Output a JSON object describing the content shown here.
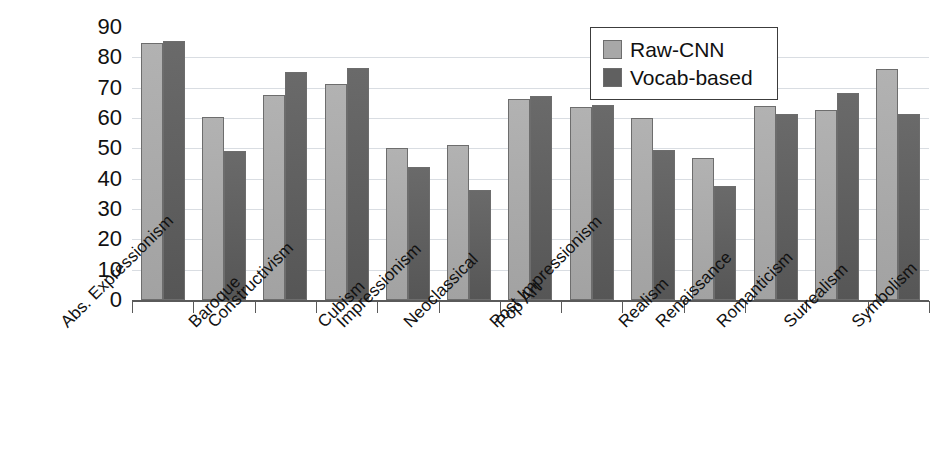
{
  "chart_data": {
    "type": "bar",
    "title": "",
    "xlabel": "",
    "ylabel": "",
    "ylim": [
      0,
      90
    ],
    "ytick_values": [
      90,
      80,
      70,
      60,
      50,
      40,
      30,
      20,
      10,
      0
    ],
    "ytick_labels": [
      "90",
      "80",
      "70",
      "60",
      "50",
      "40",
      "30",
      "20",
      "10",
      "0"
    ],
    "grid": true,
    "grid_axis": "y",
    "legend_position": "top-right",
    "categories": [
      "Abs. Expressionism",
      "Baroque",
      "Constructivism",
      "Cubism",
      "Impressionism",
      "Neoclassical",
      "Pop Art",
      "Post Impressionism",
      "Realism",
      "Renaissance",
      "Romanticism",
      "Surrealism",
      "Symbolism"
    ],
    "series": [
      {
        "name": "Raw-CNN",
        "color": "#a8a8a8",
        "values": [
          84.8,
          60.3,
          67.7,
          71.2,
          50.1,
          51.0,
          66.4,
          63.7,
          60.0,
          46.8,
          63.9,
          62.6,
          76.2
        ]
      },
      {
        "name": "Vocab-based",
        "color": "#606060",
        "values": [
          85.3,
          49.2,
          75.1,
          76.6,
          43.7,
          36.2,
          67.1,
          64.2,
          49.6,
          37.6,
          61.4,
          68.3,
          61.3
        ]
      }
    ]
  },
  "legend": {
    "entries": [
      {
        "label": "Raw-CNN",
        "swatch": "raw"
      },
      {
        "label": "Vocab-based",
        "swatch": "vocab"
      }
    ]
  }
}
